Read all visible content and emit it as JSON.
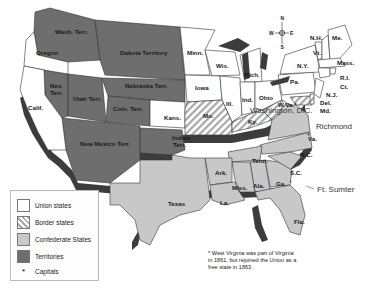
{
  "map": {
    "title": "The United States, 1861",
    "colors": {
      "union": "#ffffff",
      "border": "#e8e8e8",
      "confederate": "#c8c8c8",
      "territory": "#6e6e6e",
      "shadow": "#3c3c3c",
      "outline": "#333333"
    },
    "compass": {
      "n": "N",
      "s": "S",
      "e": "E",
      "w": "W"
    },
    "labels": {
      "wash": "Wash. Terr.",
      "oregon": "Oregon",
      "dakota": "Dakota Territory",
      "calif": "Calif.",
      "nev1": "Nev.",
      "nev2": "Terr.",
      "utah": "Utah Terr.",
      "nebraska": "Nebraska Terr.",
      "colo": "Colo. Terr.",
      "kans": "Kans.",
      "newmexico": "New Mexico Terr.",
      "indian1": "Indian",
      "indian2": "Terr.",
      "minn": "Minn.",
      "wis": "Wis.",
      "mich": "Mich.",
      "iowa": "Iowa",
      "ill": "Ill.",
      "ind": "Ind.",
      "ohio": "Ohio",
      "mo": "Mo.",
      "ky": "Ky.",
      "wva": "W.Va.*",
      "pa": "Pa.",
      "ny": "N.Y.",
      "nh": "N.H.",
      "vt": "Vt.",
      "me": "Me.",
      "mass": "Mass.",
      "ri": "R.I.",
      "ct": "Ct.",
      "nj": "N.J.",
      "del": "Del.",
      "md": "Md.",
      "va": "Va.",
      "nc": "N.C.",
      "sc": "S.C.",
      "tenn": "Tenn.",
      "ark": "Ark.",
      "miss": "Miss.",
      "ala": "Ala.",
      "ga": "Ga.",
      "la": "La.",
      "texas": "Texas",
      "fla": "Fla.",
      "washington_dc": "Washington, D.C.",
      "richmond": "Richmond",
      "ft_sumter": "Ft. Sumter"
    }
  },
  "legend": {
    "items": [
      {
        "label": "Union states",
        "color": "#ffffff"
      },
      {
        "label": "Border states",
        "color": "hatch"
      },
      {
        "label": "Confederate States",
        "color": "#c8c8c8"
      },
      {
        "label": "Territories",
        "color": "#6e6e6e"
      },
      {
        "label": "Capitals",
        "symbol": "*"
      }
    ]
  },
  "footnote": "* West Virginia was part of Virginia in 1861, but rejoined the Union as a free state in 1863."
}
